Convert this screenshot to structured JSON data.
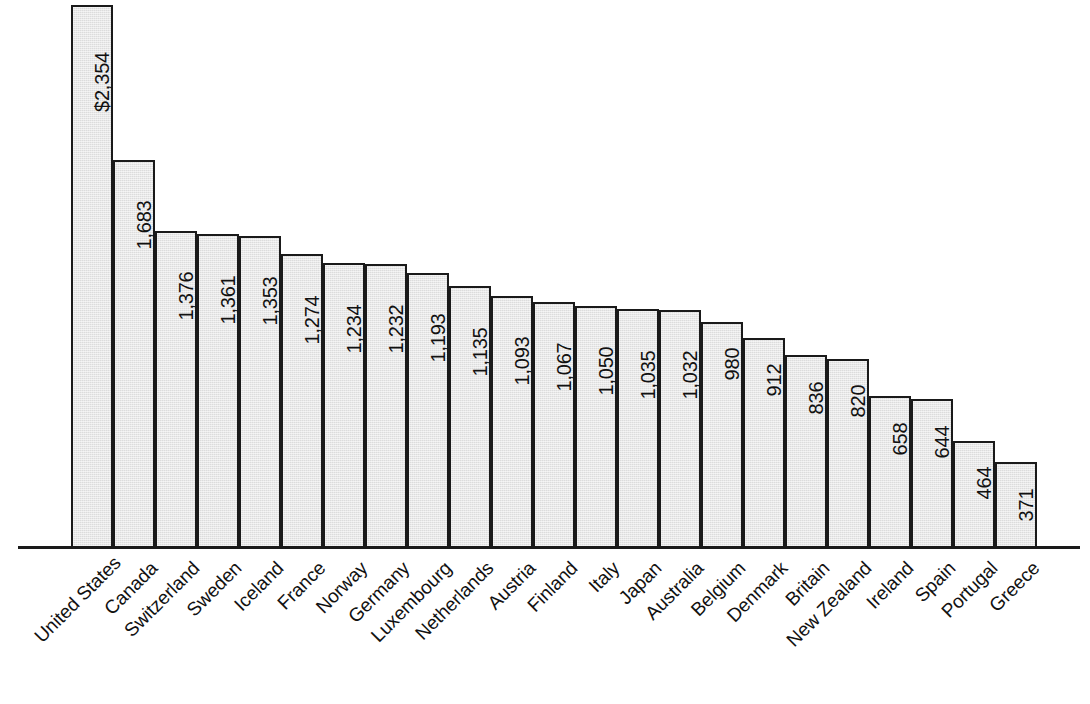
{
  "chart_data": {
    "type": "bar",
    "title": "",
    "subtitle": "",
    "xlabel": "",
    "ylabel": "",
    "ylim": [
      0,
      2354
    ],
    "grid": false,
    "legend": "none",
    "orientation": "vertical",
    "value_label_rotation": "vertical-bottom-to-top",
    "category_label_rotation": "45-degrees",
    "categories": [
      "United States",
      "Canada",
      "Switzerland",
      "Sweden",
      "Iceland",
      "France",
      "Norway",
      "Germany",
      "Luxembourg",
      "Netherlands",
      "Austria",
      "Finland",
      "Italy",
      "Japan",
      "Australia",
      "Belgium",
      "Denmark",
      "Britain",
      "New Zealand",
      "Ireland",
      "Spain",
      "Portugal",
      "Greece"
    ],
    "values": [
      2354,
      1683,
      1376,
      1361,
      1353,
      1274,
      1234,
      1232,
      1193,
      1135,
      1093,
      1067,
      1050,
      1035,
      1032,
      980,
      912,
      836,
      820,
      658,
      644,
      464,
      371
    ],
    "value_labels": [
      "$2,354",
      "1,683",
      "1,376",
      "1,361",
      "1,353",
      "1,274",
      "1,234",
      "1,232",
      "1,193",
      "1,135",
      "1,093",
      "1,067",
      "1,050",
      "1,035",
      "1,032",
      "980",
      "912",
      "836",
      "820",
      "658",
      "644",
      "464",
      "371"
    ]
  },
  "style": {
    "bar_fill": "#dcdcdc",
    "bar_stroke": "#1a1a1a",
    "axis_color": "#1a1a1a",
    "text_color": "#111111",
    "background": "#ffffff"
  }
}
